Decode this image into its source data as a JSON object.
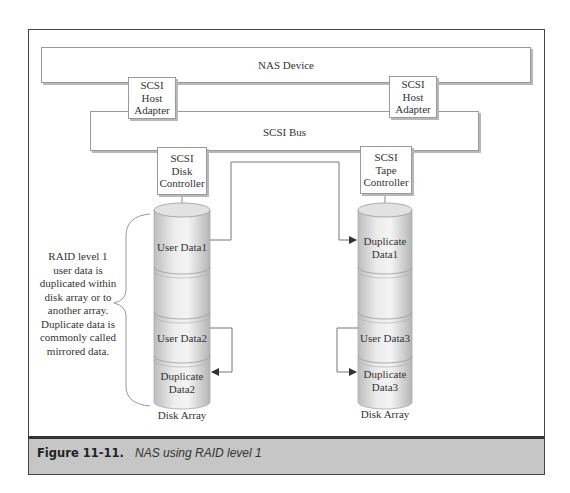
{
  "diagram": {
    "nas_device": "NAS Device",
    "host_adapter_left": [
      "SCSI",
      "Host",
      "Adapter"
    ],
    "host_adapter_right": [
      "SCSI",
      "Host",
      "Adapter"
    ],
    "scsi_bus": "SCSI Bus",
    "disk_controller": [
      "SCSI",
      "Disk",
      "Controller"
    ],
    "tape_controller": [
      "SCSI",
      "Tape",
      "Controller"
    ],
    "left_array": {
      "segments": [
        "User Data1",
        "",
        "User Data2",
        "Duplicate Data2"
      ],
      "label": "Disk Array"
    },
    "right_array": {
      "segments": [
        "Duplicate Data1",
        "",
        "User Data3",
        "Duplicate Data3"
      ],
      "label": "Disk Array"
    },
    "note": "RAID level 1 user data is duplicated within disk array or to another array. Duplicate data is commonly called mirrored data."
  },
  "caption": {
    "number": "Figure 11-11.",
    "text": "NAS using RAID level 1"
  }
}
